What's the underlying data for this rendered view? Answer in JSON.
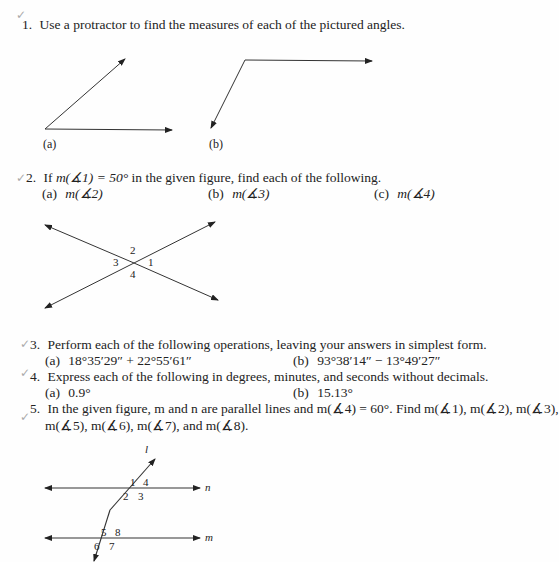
{
  "problems": [
    {
      "number": "1.",
      "text": "Use a protractor to find the measures of each of the pictured angles.",
      "figure_labels": [
        "(a)",
        "(b)"
      ]
    },
    {
      "number": "2.",
      "text_prefix": "If ",
      "text_math": "m(∡1) = 50°",
      "text_suffix": " in the given figure, find each of the following.",
      "parts": [
        {
          "label": "(a)",
          "expr": "m(∡2)"
        },
        {
          "label": "(b)",
          "expr": "m(∡3)"
        },
        {
          "label": "(c)",
          "expr": "m(∡4)"
        }
      ],
      "angle_labels": [
        "1",
        "2",
        "3",
        "4"
      ]
    },
    {
      "number": "3.",
      "text": "Perform each of the following operations, leaving your answers in simplest form.",
      "parts": [
        {
          "label": "(a)",
          "expr": "18°35′29″ + 22°55′61″"
        },
        {
          "label": "(b)",
          "expr": "93°38′14″ − 13°49′27″"
        }
      ]
    },
    {
      "number": "4.",
      "text": "Express each of the following in degrees, minutes, and seconds without decimals.",
      "parts": [
        {
          "label": "(a)",
          "expr": "0.9°"
        },
        {
          "label": "(b)",
          "expr": "15.13°"
        }
      ]
    },
    {
      "number": "5.",
      "line1": "In the given figure, m and n are parallel lines and m(∡4) = 60°. Find m(∡1), m(∡2), m(∡3),",
      "line2": "m(∡5), m(∡6), m(∡7), and m(∡8).",
      "angle_labels": [
        "1",
        "2",
        "3",
        "4",
        "5",
        "6",
        "7",
        "8"
      ],
      "line_labels": {
        "transversal": "l",
        "top": "n",
        "bottom": "m"
      }
    }
  ],
  "marks": {
    "check": "✓"
  }
}
